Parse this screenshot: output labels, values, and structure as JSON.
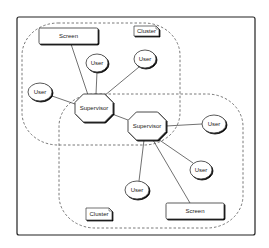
{
  "diagram": {
    "frame": {
      "x": 17,
      "y": 17,
      "w": 238,
      "h": 218
    },
    "colors": {
      "stroke": "#333333",
      "fill": "#ffffff",
      "shadow": "#444444",
      "dash": "#555555",
      "frame": "#222222"
    },
    "clusters": [
      {
        "id": "cluster-top",
        "label": "Cluster",
        "x": 22,
        "y": 23,
        "w": 158,
        "h": 122,
        "rx": 36,
        "label_box": {
          "x": 134,
          "y": 26,
          "w": 25,
          "h": 10
        }
      },
      {
        "id": "cluster-bottom",
        "label": "Cluster",
        "x": 59,
        "y": 94,
        "w": 184,
        "h": 134,
        "rx": 36,
        "label_box": {
          "x": 86,
          "y": 208,
          "w": 26,
          "h": 12
        }
      }
    ],
    "nodes": [
      {
        "id": "screen-top",
        "type": "screen",
        "label": "Screen",
        "x": 39,
        "y": 28,
        "w": 59,
        "h": 16
      },
      {
        "id": "user-top-mid",
        "type": "user",
        "label": "User",
        "cx": 97,
        "cy": 63,
        "rx": 11,
        "ry": 9
      },
      {
        "id": "user-top-right",
        "type": "user",
        "label": "User",
        "cx": 145,
        "cy": 59,
        "rx": 11,
        "ry": 9
      },
      {
        "id": "user-left",
        "type": "user",
        "label": "User",
        "cx": 40,
        "cy": 92,
        "rx": 12,
        "ry": 9
      },
      {
        "id": "supervisor-1",
        "type": "supervisor",
        "label": "Supervisor",
        "cx": 94,
        "cy": 108,
        "w": 38,
        "h": 28
      },
      {
        "id": "supervisor-2",
        "type": "supervisor",
        "label": "Supervisor",
        "cx": 147,
        "cy": 126,
        "w": 38,
        "h": 28
      },
      {
        "id": "user-right",
        "type": "user",
        "label": "User",
        "cx": 214,
        "cy": 124,
        "rx": 12,
        "ry": 9
      },
      {
        "id": "user-right-lower",
        "type": "user",
        "label": "User",
        "cx": 201,
        "cy": 170,
        "rx": 11,
        "ry": 9
      },
      {
        "id": "user-bottom",
        "type": "user",
        "label": "User",
        "cx": 137,
        "cy": 190,
        "rx": 12,
        "ry": 9
      },
      {
        "id": "screen-bottom",
        "type": "screen",
        "label": "Screen",
        "x": 166,
        "y": 203,
        "w": 58,
        "h": 16
      }
    ],
    "edges": [
      {
        "from": "screen-top",
        "to": "supervisor-1",
        "x1": 71,
        "y1": 44,
        "x2": 88,
        "y2": 95
      },
      {
        "from": "user-top-mid",
        "to": "supervisor-1",
        "x1": 97,
        "y1": 72,
        "x2": 96,
        "y2": 94
      },
      {
        "from": "user-top-right",
        "to": "supervisor-1",
        "x1": 139,
        "y1": 67,
        "x2": 104,
        "y2": 96
      },
      {
        "from": "user-left",
        "to": "supervisor-1",
        "x1": 52,
        "y1": 96,
        "x2": 75,
        "y2": 104
      },
      {
        "from": "supervisor-1",
        "to": "supervisor-2",
        "x1": 112,
        "y1": 114,
        "x2": 128,
        "y2": 120
      },
      {
        "from": "supervisor-2",
        "to": "user-right",
        "x1": 166,
        "y1": 126,
        "x2": 202,
        "y2": 124
      },
      {
        "from": "supervisor-2",
        "to": "user-right-lower",
        "x1": 158,
        "y1": 139,
        "x2": 193,
        "y2": 163
      },
      {
        "from": "supervisor-2",
        "to": "user-bottom",
        "x1": 144,
        "y1": 140,
        "x2": 139,
        "y2": 181
      },
      {
        "from": "supervisor-2",
        "to": "screen-bottom",
        "x1": 153,
        "y1": 140,
        "x2": 190,
        "y2": 203
      }
    ]
  }
}
